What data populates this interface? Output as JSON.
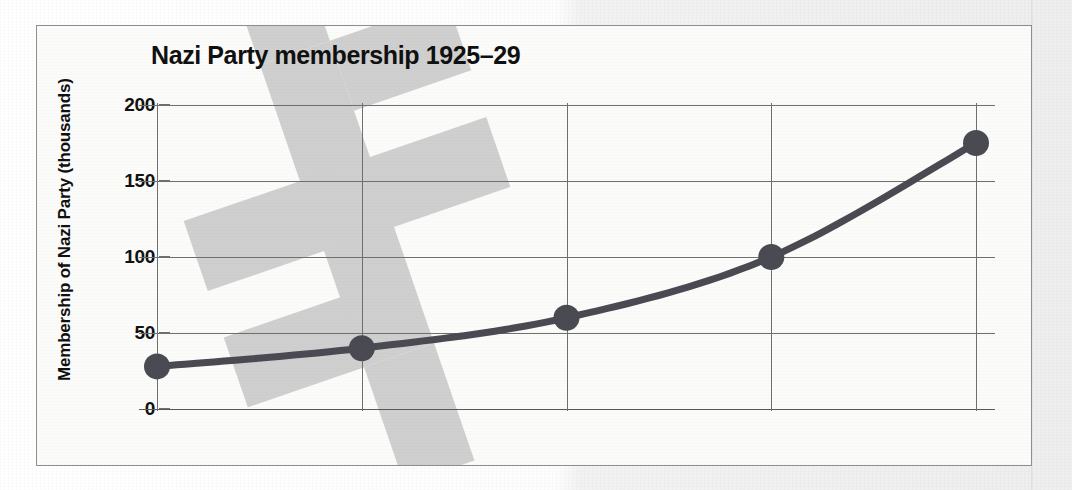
{
  "chart_data": {
    "type": "line",
    "title": "Nazi Party membership 1925–29",
    "xlabel": "",
    "ylabel": "Membership of Nazi Party (thousands)",
    "categories": [
      "1925",
      "1926",
      "1927",
      "1928",
      "1929"
    ],
    "values": [
      28,
      40,
      60,
      100,
      175
    ],
    "series": [
      {
        "name": "Membership of Nazi Party (thousands)",
        "values": [
          28,
          40,
          60,
          100,
          175
        ]
      }
    ],
    "yticks": [
      "0",
      "50",
      "100",
      "150",
      "200"
    ],
    "ytick_values": [
      0,
      50,
      100,
      150,
      200
    ],
    "ylim": [
      0,
      200
    ],
    "grid": true,
    "legend": "none",
    "marker": "circle",
    "colors": {
      "line": "#4a4a52",
      "marker": "#4a4a52",
      "grid": "#6f6f6f",
      "axis": "#585858",
      "text": "#101010",
      "plot_background": "#fbfbfa",
      "watermark": "#cfcfcf",
      "frame_border": "#8e8e8e"
    }
  }
}
